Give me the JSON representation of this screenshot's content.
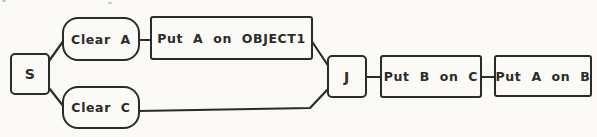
{
  "nodes": {
    "s": {
      "label": "S",
      "shape": "square"
    },
    "clear_a": {
      "label": "Clear A",
      "shape": "rounded"
    },
    "put_a_on_object1": {
      "label": "Put A on OBJECT1",
      "shape": "rect"
    },
    "clear_c": {
      "label": "Clear C",
      "shape": "rounded"
    },
    "j": {
      "label": "J",
      "shape": "square"
    },
    "put_b_on_c": {
      "label": "Put B on C",
      "shape": "rect"
    },
    "put_a_on_b": {
      "label": "Put A on B",
      "shape": "rect"
    }
  },
  "edges": [
    {
      "from": "S",
      "to": "Clear A"
    },
    {
      "from": "S",
      "to": "Clear C"
    },
    {
      "from": "Clear A",
      "to": "Put A on OBJECT1"
    },
    {
      "from": "Put A on OBJECT1",
      "to": "J"
    },
    {
      "from": "Clear C",
      "to": "J"
    },
    {
      "from": "J",
      "to": "Put B on C"
    },
    {
      "from": "Put B on C",
      "to": "Put A on B"
    }
  ],
  "colors": {
    "ink": "#2b2b28",
    "paper": "#fbfaf6"
  }
}
